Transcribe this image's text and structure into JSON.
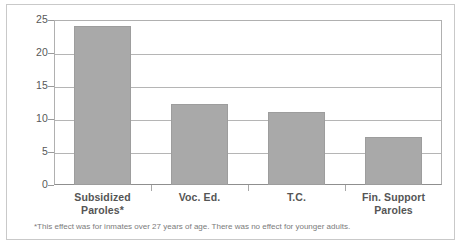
{
  "chart_data": {
    "type": "bar",
    "title": "",
    "subtitle": "",
    "xlabel": "",
    "ylabel": "",
    "categories": [
      "Subsidized Paroles*",
      "Voc. Ed.",
      "T.C.",
      "Fin. Support Paroles"
    ],
    "category_lines": [
      [
        "Subsidized",
        "Paroles*"
      ],
      [
        "Voc. Ed.",
        ""
      ],
      [
        "T.C.",
        ""
      ],
      [
        "Fin. Support",
        "Paroles"
      ]
    ],
    "values": [
      24.1,
      12.2,
      11.1,
      7.2
    ],
    "ylim": [
      0,
      25
    ],
    "yticks": [
      0,
      5,
      10,
      15,
      20,
      25
    ],
    "ytick_labels": [
      "0",
      "5",
      "10",
      "15",
      "20",
      "25"
    ],
    "grid": true,
    "legend": "none",
    "bar_color": "#a9a9a9",
    "grid_color": "#b5b5b5",
    "axis_color": "#8f8f8f",
    "text_color": "#555555"
  },
  "annotations": {
    "footnote": "*This effect was for inmates over 27 years of age. There was no effect for younger adults."
  }
}
